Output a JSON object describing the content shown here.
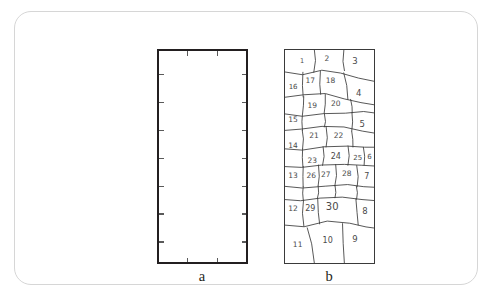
{
  "figure": {
    "background_color": "#ffffff",
    "card_border_color": "#d6d6d6",
    "ink_color": "#231f20",
    "sketch_color": "#4a4a4a"
  },
  "panel_a": {
    "caption": "a",
    "name": "empty-domain-rectangle",
    "border_color": "#231f20",
    "fill_color": "#ffffff",
    "tick_color": "#5a5a5a",
    "ticks": {
      "top": [
        0.33,
        0.66
      ],
      "bottom": [
        0.33,
        0.66
      ],
      "left": [
        0.115,
        0.245,
        0.375,
        0.505,
        0.635,
        0.765,
        0.895
      ],
      "right": [
        0.115,
        0.245,
        0.375,
        0.505,
        0.635,
        0.765,
        0.895
      ]
    }
  },
  "panel_b": {
    "caption": "b",
    "name": "hand-drawn-numbered-mesh",
    "border_color": "#3a3a3a",
    "cells": [
      {
        "label": "1",
        "x": 0.2,
        "y": 0.055,
        "size": 6.5
      },
      {
        "label": "2",
        "x": 0.47,
        "y": 0.048,
        "size": 7.5
      },
      {
        "label": "3",
        "x": 0.78,
        "y": 0.055,
        "size": 8.5
      },
      {
        "label": "16",
        "x": 0.1,
        "y": 0.175,
        "size": 7.0
      },
      {
        "label": "17",
        "x": 0.29,
        "y": 0.15,
        "size": 7.5
      },
      {
        "label": "18",
        "x": 0.51,
        "y": 0.15,
        "size": 7.5
      },
      {
        "label": "4",
        "x": 0.82,
        "y": 0.205,
        "size": 8.5
      },
      {
        "label": "15",
        "x": 0.1,
        "y": 0.33,
        "size": 7.5
      },
      {
        "label": "19",
        "x": 0.31,
        "y": 0.265,
        "size": 7.5
      },
      {
        "label": "20",
        "x": 0.57,
        "y": 0.255,
        "size": 7.5
      },
      {
        "label": "5",
        "x": 0.86,
        "y": 0.35,
        "size": 8.5
      },
      {
        "label": "14",
        "x": 0.1,
        "y": 0.45,
        "size": 7.5
      },
      {
        "label": "21",
        "x": 0.33,
        "y": 0.405,
        "size": 7.5
      },
      {
        "label": "22",
        "x": 0.6,
        "y": 0.405,
        "size": 7.5
      },
      {
        "label": "23",
        "x": 0.31,
        "y": 0.52,
        "size": 7.5
      },
      {
        "label": "24",
        "x": 0.57,
        "y": 0.5,
        "size": 8.0
      },
      {
        "label": "25",
        "x": 0.81,
        "y": 0.505,
        "size": 7.0
      },
      {
        "label": "6",
        "x": 0.94,
        "y": 0.5,
        "size": 7.0
      },
      {
        "label": "13",
        "x": 0.1,
        "y": 0.59,
        "size": 7.5
      },
      {
        "label": "26",
        "x": 0.3,
        "y": 0.59,
        "size": 7.5
      },
      {
        "label": "27",
        "x": 0.46,
        "y": 0.585,
        "size": 7.5
      },
      {
        "label": "28",
        "x": 0.69,
        "y": 0.58,
        "size": 7.5
      },
      {
        "label": "7",
        "x": 0.91,
        "y": 0.595,
        "size": 8.0
      },
      {
        "label": "12",
        "x": 0.1,
        "y": 0.745,
        "size": 7.5
      },
      {
        "label": "29",
        "x": 0.29,
        "y": 0.745,
        "size": 8.0
      },
      {
        "label": "30",
        "x": 0.53,
        "y": 0.735,
        "size": 10.0
      },
      {
        "label": "8",
        "x": 0.89,
        "y": 0.755,
        "size": 8.5
      },
      {
        "label": "11",
        "x": 0.15,
        "y": 0.91,
        "size": 7.5
      },
      {
        "label": "10",
        "x": 0.48,
        "y": 0.895,
        "size": 8.0
      },
      {
        "label": "9",
        "x": 0.78,
        "y": 0.885,
        "size": 8.5
      }
    ]
  }
}
